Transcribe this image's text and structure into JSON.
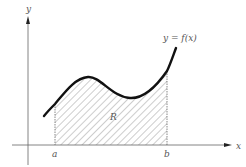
{
  "diagram": {
    "function_label": "y = f(x)",
    "axis_labels": {
      "x": "x",
      "y": "y"
    },
    "bounds": {
      "a": "a",
      "b": "b"
    },
    "region_label": "R",
    "colors": {
      "curve": "#111111",
      "axis": "#666666",
      "hatch": "#555555"
    }
  }
}
